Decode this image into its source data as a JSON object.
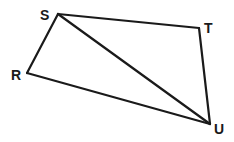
{
  "diagram": {
    "type": "quadrilateral-with-diagonal",
    "colors": {
      "line": "#1a1a1a",
      "background": "#ffffff"
    },
    "vertices": [
      {
        "id": "S",
        "label": "S",
        "x": 58,
        "y": 14,
        "label_x": 40,
        "label_y": 20
      },
      {
        "id": "T",
        "label": "T",
        "x": 199,
        "y": 28,
        "label_x": 204,
        "label_y": 33
      },
      {
        "id": "U",
        "label": "U",
        "x": 210,
        "y": 124,
        "label_x": 214,
        "label_y": 134
      },
      {
        "id": "R",
        "label": "R",
        "x": 27,
        "y": 73,
        "label_x": 11,
        "label_y": 80
      }
    ],
    "edges": [
      {
        "id": "ST",
        "from": "S",
        "to": "T"
      },
      {
        "id": "TU",
        "from": "T",
        "to": "U"
      },
      {
        "id": "UR",
        "from": "U",
        "to": "R"
      },
      {
        "id": "RS",
        "from": "R",
        "to": "S"
      },
      {
        "id": "SU",
        "from": "S",
        "to": "U",
        "kind": "diagonal"
      }
    ]
  }
}
